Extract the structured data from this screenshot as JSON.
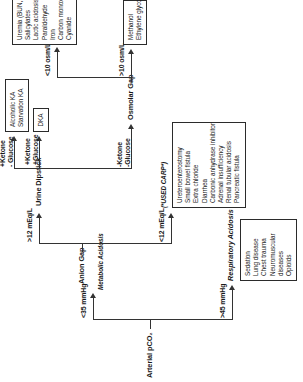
{
  "diagram": {
    "orientation": "rotated-90-ccw",
    "root": "Arterial  pCO₂",
    "branches": {
      "metabolic_value": "<35 mmHg",
      "metabolic_label": "Metabolic Acidosis",
      "respiratory_value": ">45 mmHg",
      "respiratory_label": "Respiratory Acidosis"
    },
    "anion_gap": {
      "node": "Anion Gap",
      "high_label": ">12 mEq/L",
      "low_label": "<12 mEq/L",
      "low_mnemonic": "(*USED CARP*)"
    },
    "urine_dipstick": {
      "node": "Urine Dipstick",
      "branch_top": "+Ketone\n- Glucose",
      "branch_top_line1": "+Ketone",
      "branch_top_line2": "- Glucose",
      "branch_mid_line1": "+Ketone",
      "branch_mid_line2": "+Glucose",
      "branch_bot_line1": "-Ketone",
      "branch_bot_line2": "-Glucose"
    },
    "osmolar_gap": {
      "node": "Osmolar Gap",
      "high_label": ">10 osm/L",
      "low_label": "<10 osm/L"
    },
    "outcome_boxes": {
      "ketoacidosis": [
        "Alcoholic KA",
        "Starvation KA"
      ],
      "dka": [
        "DKA"
      ],
      "toxic_alcohols": [
        "Methanol",
        "Ethylene glycol"
      ],
      "mudpiles": [
        "Uremia (BUN, Creat)",
        "Salicylates",
        "Lactic acidosis",
        "Paraldehyde",
        "Iron",
        "Carbon monoxide",
        "Cyanide"
      ],
      "used_carp": [
        "Ureteroenterostomy",
        "Small bowel fistula",
        "Extra chloride",
        "Diarrhea",
        "Carbonic anhydrase inhibitor",
        "Adrenal insufficiency",
        "Renal tubular acidosis",
        "Pancreatic fistula"
      ],
      "respiratory_causes": [
        "Sedation",
        "Lung disease",
        "Chest trauma",
        "Neuromuscular",
        "diseases",
        "Opioids"
      ]
    },
    "colors": {
      "ink": "#1a1a1a",
      "line": "#333333",
      "background": "#ffffff",
      "box_border": "#2b2b2b"
    }
  }
}
